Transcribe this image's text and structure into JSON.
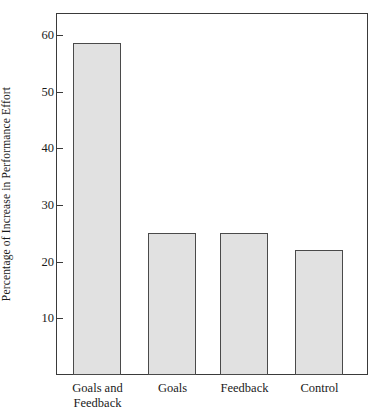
{
  "chart_data": {
    "type": "bar",
    "title": "",
    "xlabel": "",
    "ylabel": "Percentage of Increase in Performance Effort",
    "categories": [
      "Goals and Feedback",
      "Goals",
      "Feedback",
      "Control"
    ],
    "values": [
      58.5,
      25,
      25,
      22
    ],
    "ylim": [
      0,
      64
    ],
    "yticks": [
      10,
      20,
      30,
      40,
      50,
      60
    ],
    "ytick_labels": [
      "10",
      "20",
      "30",
      "40",
      "50",
      "60"
    ],
    "grid": false,
    "legend": "none",
    "bar_fill_color": "#e1e1e1",
    "bar_edge_color": "#4a4a4a",
    "axis_color": "#3a3a3a",
    "background_color": "#ffffff"
  },
  "axis": {
    "y_title": "Percentage of Increase in Performance Effort",
    "ticks": [
      {
        "label": "60",
        "value": 60
      },
      {
        "label": "50",
        "value": 50
      },
      {
        "label": "40",
        "value": 40
      },
      {
        "label": "30",
        "value": 30
      },
      {
        "label": "20",
        "value": 20
      },
      {
        "label": "10",
        "value": 10
      }
    ]
  },
  "bars": [
    {
      "label_line1": "Goals and",
      "label_line2": "Feedback",
      "value": 58.5
    },
    {
      "label_line1": "Goals",
      "label_line2": "",
      "value": 25
    },
    {
      "label_line1": "Feedback",
      "label_line2": "",
      "value": 25
    },
    {
      "label_line1": "Control",
      "label_line2": "",
      "value": 22
    }
  ]
}
